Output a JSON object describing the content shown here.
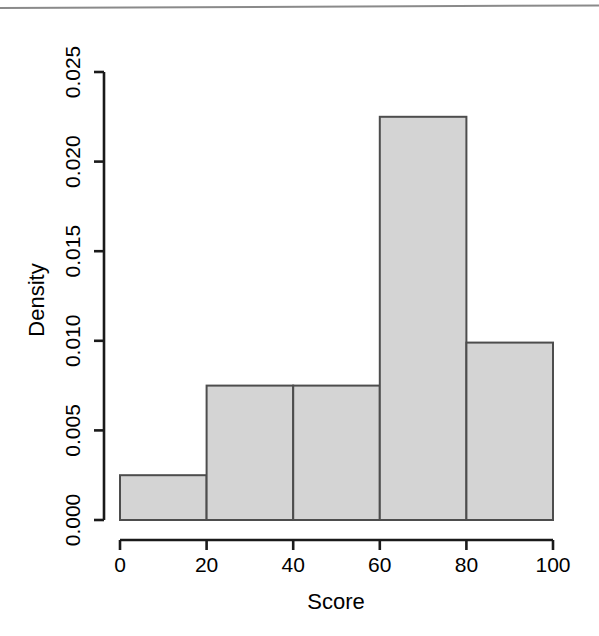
{
  "chart_data": {
    "type": "bar",
    "title": "",
    "subtitle": "",
    "xlabel": "Score",
    "ylabel": "Density",
    "categories": [
      "0-20",
      "20-40",
      "40-60",
      "60-80",
      "80-100"
    ],
    "bin_edges": [
      0,
      20,
      40,
      60,
      80,
      100
    ],
    "values": [
      0.0025,
      0.0075,
      0.0075,
      0.0225,
      0.0099
    ],
    "xlim": [
      0,
      100
    ],
    "ylim": [
      0.0,
      0.025
    ],
    "xticks": [
      0,
      20,
      40,
      60,
      80,
      100
    ],
    "xtick_labels": [
      "0",
      "20",
      "40",
      "60",
      "80",
      "100"
    ],
    "yticks": [
      0.0,
      0.005,
      0.01,
      0.015,
      0.02,
      0.025
    ],
    "ytick_labels": [
      "0.000",
      "0.005",
      "0.010",
      "0.015",
      "0.020",
      "0.025"
    ],
    "grid": false,
    "legend": null,
    "legend_position": "none",
    "bar_fill_color": "#d4d4d4",
    "bar_border_color": "#4d4d4d",
    "axis_color": "#1a1a1a",
    "background_color": "#ffffff"
  },
  "figure": {
    "top_rule_color": "#8a8a8a"
  }
}
